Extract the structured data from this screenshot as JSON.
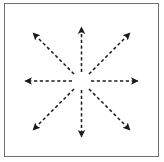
{
  "diagram": {
    "center_label": "Cell",
    "grid": {
      "rows": 3,
      "cols": 3,
      "border_color": "#6e6e6e",
      "shaded_color": "#d4d4d4",
      "plain_color": "#ffffff",
      "arrow_color": "#1a1a1a",
      "arrow_style": "dashed"
    },
    "cells": [
      {
        "id": "top-left",
        "label": "( 1, –1 )",
        "shaded": false,
        "arrow": "up-left"
      },
      {
        "id": "top-center",
        "label": "( 1, 0 )",
        "shaded": true,
        "arrow": "up"
      },
      {
        "id": "top-right",
        "label": "( 1, 1 )",
        "shaded": false,
        "arrow": "up-right"
      },
      {
        "id": "middle-left",
        "label": "( 0, –1 )",
        "shaded": true,
        "arrow": "left"
      },
      {
        "id": "center",
        "label": "Cell",
        "shaded": false,
        "arrow": "none"
      },
      {
        "id": "middle-right",
        "label": "( 0, 1 )",
        "shaded": true,
        "arrow": "right"
      },
      {
        "id": "bottom-left",
        "label": "( –1, –1 )",
        "shaded": false,
        "arrow": "down-left"
      },
      {
        "id": "bottom-center",
        "label": "( –1, 0 )",
        "shaded": true,
        "arrow": "down"
      },
      {
        "id": "bottom-right",
        "label": "( –1, 1 )",
        "shaded": false,
        "arrow": "down-right"
      }
    ]
  }
}
